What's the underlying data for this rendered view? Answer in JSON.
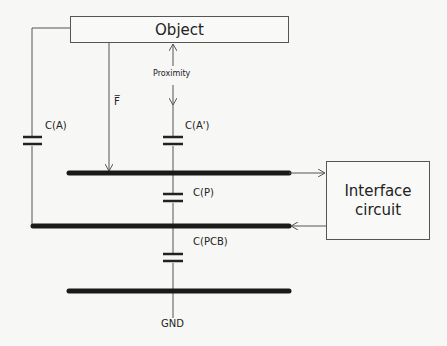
{
  "diagram": {
    "object_box": {
      "label": "Object"
    },
    "interface_box": {
      "line1": "Interface",
      "line2": "circuit"
    },
    "labels": {
      "proximity": "Proximity",
      "force": "F̅",
      "cap_a": "C(A)",
      "cap_a_prime": "C(A')",
      "cap_p": "C(P)",
      "cap_pcb": "C(PCB)",
      "ground": "GND"
    },
    "colors": {
      "line": "#555555",
      "electrode": "#1a1a1a",
      "background": "#f7f7f5"
    }
  }
}
